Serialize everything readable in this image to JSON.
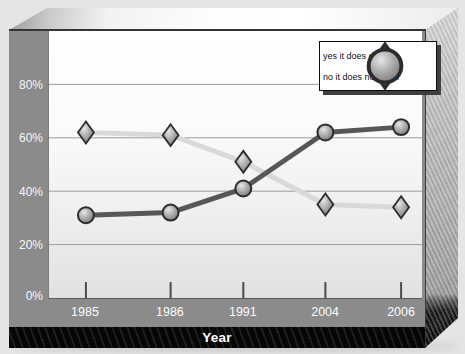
{
  "chart_data": {
    "type": "line",
    "categories": [
      "1985",
      "1986",
      "1991",
      "2004",
      "2006"
    ],
    "series": [
      {
        "name": "yes it does deter",
        "marker": "diamond",
        "line_color": "#d9d9d9",
        "values": [
          62,
          61,
          51,
          35,
          34
        ]
      },
      {
        "name": "no it does not deter",
        "marker": "circle",
        "line_color": "#575757",
        "values": [
          31,
          32,
          41,
          62,
          64
        ]
      }
    ],
    "title": "",
    "xlabel": "Year",
    "ylabel": "",
    "y_ticks": [
      "80%",
      "60%",
      "40%",
      "20%",
      "0%"
    ],
    "ylim": [
      0,
      100
    ],
    "grid": true,
    "legend_position": "top-right"
  },
  "colors": {
    "frame_gray": "#8b8b8b",
    "plot_gridline": "#9c9c9c",
    "line_yes": "#d9d9d9",
    "line_no": "#575757",
    "marker_outline": "#2c2c2c",
    "footer_black": "#111111",
    "axis_label_text": "#f7f7f7"
  }
}
